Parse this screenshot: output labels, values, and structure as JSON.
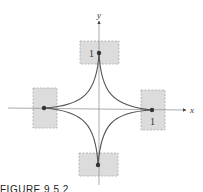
{
  "figure": {
    "caption": "FIGURE 9.5.2",
    "axes": {
      "x_label": "x",
      "y_label": "y"
    },
    "curve": "astroid x^(2/3) + y^(2/3) = 1",
    "tick_labels": {
      "top": "1",
      "right": "1"
    },
    "cusps": [
      {
        "name": "top",
        "x": 0,
        "y": 1
      },
      {
        "name": "right",
        "x": 1,
        "y": 0
      },
      {
        "name": "bottom",
        "x": 0,
        "y": -1
      },
      {
        "name": "left",
        "x": -1,
        "y": 0
      }
    ],
    "colors": {
      "curve": "#555555",
      "axis": "#777777",
      "highlight_box": "#d9d9d9",
      "box_border": "#a0a0a0",
      "point": "#333333"
    }
  }
}
